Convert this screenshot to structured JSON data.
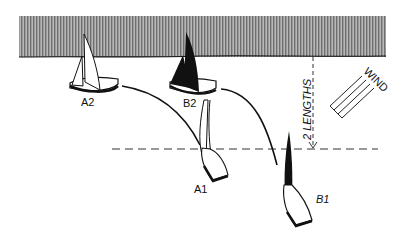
{
  "diagram": {
    "shore_label": "",
    "boats": [
      {
        "id": "A2",
        "label": "A2",
        "sail": "white"
      },
      {
        "id": "B2",
        "label": "B2",
        "sail": "black"
      },
      {
        "id": "A1",
        "label": "A1",
        "sail": "white"
      },
      {
        "id": "B1",
        "label": "B1",
        "sail": "black"
      }
    ],
    "distance_label": "2 LENGTHS",
    "wind_label": "WIND",
    "colors": {
      "shore_fill": "#9a9a9a",
      "ink": "#111111",
      "background": "#ffffff"
    }
  }
}
